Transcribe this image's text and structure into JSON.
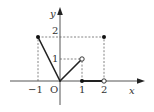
{
  "axes": {
    "x_label": "x",
    "y_label": "y",
    "origin_label": "O",
    "x_ticks": [
      {
        "value": -1,
        "label": "−1"
      },
      {
        "value": 1,
        "label": "1"
      },
      {
        "value": 2,
        "label": "2"
      }
    ],
    "y_ticks": [
      {
        "value": 1,
        "label": "1"
      },
      {
        "value": 2,
        "label": "2"
      }
    ]
  },
  "function": {
    "type": "piecewise",
    "segments": [
      {
        "from": [
          -1,
          2
        ],
        "to": [
          0,
          0
        ],
        "start": "closed",
        "end": "continuous"
      },
      {
        "from": [
          0,
          0
        ],
        "to": [
          1,
          1
        ],
        "start": "continuous",
        "end": "open"
      },
      {
        "from": [
          1,
          0
        ],
        "to": [
          2,
          0
        ],
        "start": "closed",
        "end": "open"
      }
    ],
    "isolated_points": [
      {
        "point": [
          2,
          2
        ],
        "style": "closed"
      }
    ]
  },
  "guides": [
    {
      "from": [
        -1,
        0
      ],
      "to": [
        -1,
        2
      ]
    },
    {
      "from": [
        -1,
        2
      ],
      "to": [
        2,
        2
      ]
    },
    {
      "from": [
        0,
        1
      ],
      "to": [
        1,
        1
      ]
    },
    {
      "from": [
        1,
        0
      ],
      "to": [
        1,
        1
      ]
    },
    {
      "from": [
        2,
        0
      ],
      "to": [
        2,
        2
      ]
    }
  ],
  "colors": {
    "axis": "#555555",
    "curve": "#222222",
    "guide": "#666666"
  }
}
